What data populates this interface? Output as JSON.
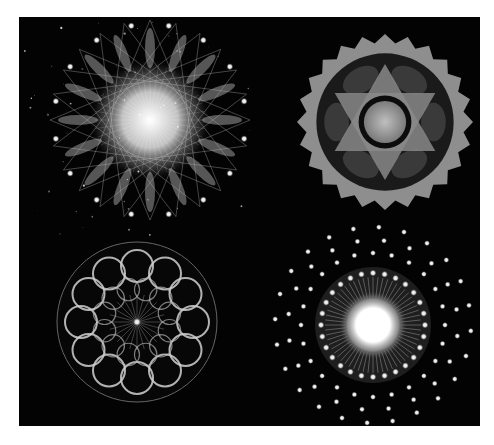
{
  "image": {
    "background": "#ffffff",
    "panel_color": "#030303",
    "mandalas": [
      {
        "name": "star-burst-mandala",
        "position": "top-left",
        "cx": 131,
        "cy": 103,
        "r": 100,
        "points": 16
      },
      {
        "name": "hexagram-gear-mandala",
        "position": "top-right",
        "cx": 366,
        "cy": 105,
        "r": 88,
        "teeth": 24
      },
      {
        "name": "ring-lattice-mandala",
        "position": "bottom-left",
        "cx": 118,
        "cy": 305,
        "r": 80,
        "rings": 12
      },
      {
        "name": "glowing-dot-mandala",
        "position": "bottom-right",
        "cx": 354,
        "cy": 308,
        "r": 100
      }
    ]
  }
}
